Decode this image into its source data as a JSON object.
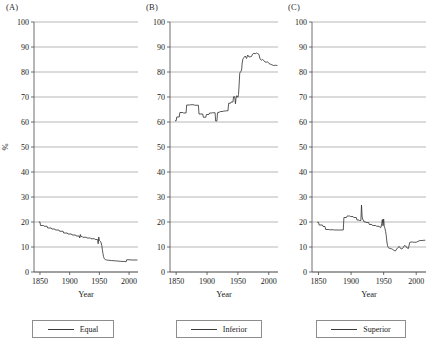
{
  "figure": {
    "panels": [
      {
        "key": "A",
        "label": "(A)",
        "legend_label": "Equal",
        "series_name": "Equal"
      },
      {
        "key": "B",
        "label": "(B)",
        "legend_label": "Inferior",
        "series_name": "Inferior"
      },
      {
        "key": "C",
        "label": "(C)",
        "legend_label": "Superior",
        "series_name": "Superior"
      }
    ],
    "axes": {
      "ylabel": "%",
      "xlabel": "Year",
      "yticks": [
        0,
        10,
        20,
        30,
        40,
        50,
        60,
        70,
        80,
        90,
        100
      ],
      "xticks": [
        1850,
        1900,
        1950,
        2000
      ],
      "ylim": [
        0,
        100
      ],
      "xlim": [
        1840,
        2015
      ],
      "grid": true,
      "legend_position": "below-axis"
    },
    "colors": {
      "line": "#2e2e2e",
      "grid": "#9a9a9a",
      "axis": "#4a4a4a",
      "background": "#ffffff"
    }
  },
  "chart_data": [
    {
      "type": "line",
      "title": "(A)",
      "xlabel": "Year",
      "ylabel": "%",
      "xlim": [
        1840,
        2015
      ],
      "ylim": [
        0,
        100
      ],
      "grid": true,
      "legend": [
        "Equal"
      ],
      "legend_position": "below",
      "series": [
        {
          "name": "Equal",
          "x": [
            1848,
            1850,
            1851,
            1856,
            1857,
            1862,
            1863,
            1869,
            1870,
            1875,
            1876,
            1882,
            1883,
            1889,
            1890,
            1896,
            1897,
            1903,
            1904,
            1910,
            1911,
            1916,
            1917,
            1918,
            1919,
            1921,
            1922,
            1928,
            1929,
            1935,
            1936,
            1942,
            1943,
            1947,
            1948,
            1949,
            1950,
            1951,
            1952,
            1953,
            1954,
            1955,
            1956,
            1957,
            1958,
            1960,
            1962,
            1965,
            1970,
            1975,
            1980,
            1985,
            1990,
            1993,
            1995,
            1996,
            2000,
            2005,
            2010,
            2014
          ],
          "y": [
            20.0,
            20.0,
            18.6,
            18.6,
            18.3,
            18.3,
            17.6,
            17.6,
            17.2,
            17.2,
            16.8,
            16.8,
            16.3,
            16.3,
            15.6,
            15.6,
            15.2,
            15.2,
            14.8,
            14.8,
            14.4,
            14.4,
            13.6,
            15.0,
            14.2,
            14.2,
            13.9,
            13.9,
            13.6,
            13.6,
            13.3,
            13.3,
            13.0,
            13.0,
            11.3,
            14.0,
            12.6,
            12.4,
            12.2,
            11.6,
            10.6,
            9.0,
            7.4,
            6.2,
            5.4,
            5.0,
            4.8,
            4.7,
            4.6,
            4.5,
            4.4,
            4.3,
            4.2,
            4.2,
            4.1,
            4.9,
            4.9,
            4.8,
            4.8,
            4.8
          ]
        }
      ]
    },
    {
      "type": "line",
      "title": "(B)",
      "xlabel": "Year",
      "ylabel": "%",
      "xlim": [
        1840,
        2015
      ],
      "ylim": [
        0,
        100
      ],
      "grid": true,
      "legend": [
        "Inferior"
      ],
      "legend_position": "below",
      "series": [
        {
          "name": "Inferior",
          "x": [
            1848,
            1850,
            1851,
            1855,
            1856,
            1861,
            1862,
            1866,
            1867,
            1872,
            1873,
            1879,
            1880,
            1886,
            1887,
            1893,
            1894,
            1898,
            1899,
            1903,
            1904,
            1908,
            1909,
            1913,
            1914,
            1916,
            1917,
            1918,
            1919,
            1921,
            1922,
            1926,
            1927,
            1930,
            1931,
            1934,
            1935,
            1938,
            1939,
            1942,
            1943,
            1945,
            1946,
            1947,
            1948,
            1949,
            1950,
            1951,
            1952,
            1953,
            1954,
            1955,
            1956,
            1957,
            1958,
            1960,
            1962,
            1964,
            1966,
            1968,
            1970,
            1972,
            1974,
            1976,
            1978,
            1980,
            1982,
            1984,
            1986,
            1988,
            1990,
            1992,
            1994,
            1996,
            1998,
            2000,
            2002,
            2005,
            2008,
            2011,
            2014
          ],
          "y": [
            60.5,
            60.5,
            62.0,
            62.0,
            63.8,
            63.8,
            63.6,
            63.6,
            66.8,
            66.8,
            66.9,
            66.9,
            66.7,
            66.7,
            63.2,
            63.2,
            61.9,
            61.9,
            63.0,
            63.0,
            63.6,
            63.6,
            63.7,
            63.7,
            60.4,
            60.4,
            63.7,
            63.6,
            64.0,
            64.0,
            64.2,
            64.2,
            64.4,
            64.4,
            64.5,
            64.5,
            67.5,
            67.5,
            68.0,
            68.0,
            70.1,
            70.1,
            67.3,
            69.5,
            70.5,
            70.3,
            69.9,
            71.0,
            74.8,
            79.5,
            80.0,
            80.3,
            80.8,
            83.6,
            85.1,
            85.9,
            86.4,
            85.4,
            86.8,
            86.0,
            86.1,
            86.2,
            87.2,
            87.5,
            87.3,
            87.6,
            87.4,
            87.1,
            85.2,
            84.7,
            85.0,
            84.6,
            84.0,
            83.9,
            84.1,
            83.5,
            83.2,
            82.9,
            82.6,
            82.7,
            82.6
          ]
        }
      ]
    },
    {
      "type": "line",
      "title": "(C)",
      "xlabel": "Year",
      "ylabel": "%",
      "xlim": [
        1840,
        2015
      ],
      "ylim": [
        0,
        100
      ],
      "grid": true,
      "legend": [
        "Superior"
      ],
      "legend_position": "below",
      "series": [
        {
          "name": "Superior",
          "x": [
            1848,
            1850,
            1851,
            1856,
            1857,
            1860,
            1861,
            1866,
            1867,
            1873,
            1874,
            1880,
            1881,
            1888,
            1889,
            1893,
            1894,
            1898,
            1899,
            1903,
            1904,
            1908,
            1909,
            1912,
            1913,
            1915,
            1916,
            1917,
            1918,
            1919,
            1920,
            1922,
            1923,
            1927,
            1928,
            1932,
            1933,
            1938,
            1939,
            1943,
            1944,
            1946,
            1947,
            1948,
            1949,
            1950,
            1951,
            1952,
            1953,
            1954,
            1955,
            1956,
            1957,
            1958,
            1960,
            1962,
            1964,
            1966,
            1968,
            1970,
            1972,
            1974,
            1976,
            1978,
            1980,
            1982,
            1984,
            1986,
            1988,
            1990,
            1992,
            1994,
            1996,
            1998,
            2000,
            2003,
            2006,
            2009,
            2012,
            2014
          ],
          "y": [
            19.9,
            19.9,
            18.8,
            18.8,
            18.2,
            18.2,
            17.0,
            17.0,
            16.9,
            16.9,
            16.8,
            16.8,
            16.8,
            16.8,
            21.8,
            21.8,
            22.4,
            22.4,
            22.2,
            22.2,
            21.8,
            21.8,
            20.8,
            20.8,
            20.6,
            20.6,
            26.8,
            22.0,
            20.9,
            20.8,
            20.0,
            20.0,
            19.8,
            19.8,
            19.0,
            19.0,
            18.6,
            18.6,
            18.3,
            18.3,
            17.9,
            17.9,
            19.4,
            21.0,
            18.5,
            21.2,
            18.2,
            17.4,
            16.2,
            14.5,
            12.0,
            10.5,
            9.8,
            9.6,
            9.4,
            9.3,
            9.0,
            8.6,
            8.4,
            9.2,
            9.8,
            10.2,
            9.4,
            9.2,
            9.8,
            10.6,
            10.4,
            9.6,
            9.4,
            11.8,
            12.0,
            12.0,
            11.9,
            11.9,
            11.9,
            12.3,
            12.6,
            12.6,
            12.7,
            12.7
          ]
        }
      ]
    }
  ]
}
